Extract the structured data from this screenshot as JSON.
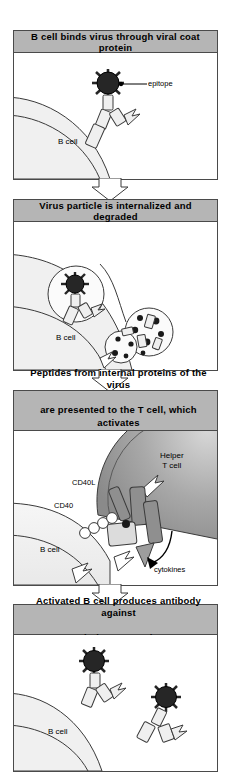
{
  "figure": {
    "type": "immunology-process-diagram",
    "panel_count": 4,
    "colors": {
      "header_fill": "#b5b5b5",
      "panel_border": "#4a4a4a",
      "bcell_fill": "#f0f0f0",
      "tcell_fill": "#9d9d9d",
      "virus_fill": "#262626",
      "arrow_outline_fill": "#ffffff",
      "cytokine_arrow_fill": "#9d9d9d",
      "background": "#ffffff"
    }
  },
  "panels": [
    {
      "index": 1,
      "header": "B cell binds virus through viral coat protein",
      "header_lines": [
        "B cell binds virus through viral coat protein"
      ],
      "labels": {
        "cell": "B cell",
        "epitope": "epitope"
      },
      "elements": [
        "virus-particle",
        "epitope-callout",
        "antibody-receptor",
        "b-cell-membrane"
      ]
    },
    {
      "index": 2,
      "header": "Virus particle is internalized and degraded",
      "header_lines": [
        "Virus particle is internalized and degraded"
      ],
      "labels": {
        "cell": "B cell"
      },
      "elements": [
        "endocytic-vesicle",
        "virus-particle",
        "antibody-receptor",
        "lysosome",
        "degraded-peptides"
      ]
    },
    {
      "index": 3,
      "header": "Peptides from internal proteins of the virus are presented to the T cell, which activates the B cell",
      "header_lines": [
        "Peptides from internal proteins of the virus",
        "are presented to the T cell, which activates",
        "the B cell"
      ],
      "labels": {
        "cell": "B cell",
        "tcell": "Helper\nT cell",
        "tcell_line1": "Helper",
        "tcell_line2": "T cell",
        "cd40l": "CD40L",
        "cd40": "CD40",
        "cytokines": "cytokines"
      },
      "elements": [
        "helper-t-cell",
        "mhc-peptide-complex",
        "tcr",
        "cd40-cd40l-pair",
        "cytokine-arrow",
        "activation-arrow"
      ]
    },
    {
      "index": 4,
      "header": "Activated B cell produces antibody against viral coat protein",
      "header_lines": [
        "Activated B cell produces antibody against",
        "viral coat protein"
      ],
      "labels": {
        "cell": "B cell"
      },
      "elements": [
        "virus-particle",
        "secreted-antibody",
        "b-cell-membrane"
      ]
    }
  ],
  "connectors": [
    {
      "from_panel": 1,
      "to_panel": 2,
      "icon": "down-arrow"
    },
    {
      "from_panel": 2,
      "to_panel": 3,
      "icon": "down-arrow"
    },
    {
      "from_panel": 3,
      "to_panel": 4,
      "icon": "down-arrow"
    }
  ]
}
